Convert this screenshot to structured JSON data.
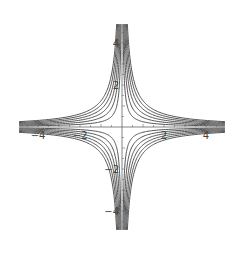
{
  "chart_data": {
    "type": "line",
    "title": "",
    "xlabel": "",
    "ylabel": "",
    "xlim": [
      -5,
      5
    ],
    "ylim": [
      -5,
      5
    ],
    "x_ticks": [
      -4,
      -2,
      2,
      4
    ],
    "y_ticks": [
      4,
      2,
      -2,
      -4
    ],
    "minor_tick_step": 0.5,
    "grid": false,
    "legend": null,
    "contour_levels": [
      1,
      2,
      3,
      4,
      5,
      6
    ],
    "series": [
      {
        "name": "quadrant-I",
        "equation": "x*y = c",
        "x_sign": 1,
        "y_sign": -1
      },
      {
        "name": "quadrant-II",
        "equation": "x*y = -c",
        "x_sign": -1,
        "y_sign": -1
      },
      {
        "name": "quadrant-III",
        "equation": "x*y = c",
        "x_sign": -1,
        "y_sign": 1
      },
      {
        "name": "quadrant-IV",
        "equation": "x*y = -c",
        "x_sign": 1,
        "y_sign": 1
      }
    ],
    "line_color": "#555555",
    "axis_color": "#666666"
  },
  "layout": {
    "origin_px": [
      122,
      127
    ],
    "unit_px": 21,
    "extent": 4.9
  }
}
